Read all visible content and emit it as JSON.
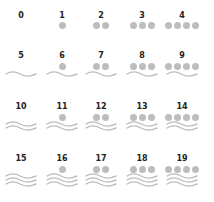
{
  "colors": {
    "dot": "#bdbdbd",
    "wave": "#bdbdbd",
    "label": "#222222",
    "background": "#ffffff"
  },
  "legend": {
    "dot_value": 1,
    "wave_value": 5
  },
  "cells": [
    {
      "label": "0",
      "dots": 0,
      "waves": 0
    },
    {
      "label": "1",
      "dots": 1,
      "waves": 0
    },
    {
      "label": "2",
      "dots": 2,
      "waves": 0
    },
    {
      "label": "3",
      "dots": 3,
      "waves": 0
    },
    {
      "label": "4",
      "dots": 4,
      "waves": 0
    },
    {
      "label": "5",
      "dots": 0,
      "waves": 1
    },
    {
      "label": "6",
      "dots": 1,
      "waves": 1
    },
    {
      "label": "7",
      "dots": 2,
      "waves": 1
    },
    {
      "label": "8",
      "dots": 3,
      "waves": 1
    },
    {
      "label": "9",
      "dots": 4,
      "waves": 1
    },
    {
      "label": "10",
      "dots": 0,
      "waves": 2
    },
    {
      "label": "11",
      "dots": 1,
      "waves": 2
    },
    {
      "label": "12",
      "dots": 2,
      "waves": 2
    },
    {
      "label": "13",
      "dots": 3,
      "waves": 2
    },
    {
      "label": "14",
      "dots": 4,
      "waves": 2
    },
    {
      "label": "15",
      "dots": 0,
      "waves": 3
    },
    {
      "label": "16",
      "dots": 1,
      "waves": 3
    },
    {
      "label": "17",
      "dots": 2,
      "waves": 3
    },
    {
      "label": "18",
      "dots": 3,
      "waves": 3
    },
    {
      "label": "19",
      "dots": 4,
      "waves": 3
    }
  ]
}
